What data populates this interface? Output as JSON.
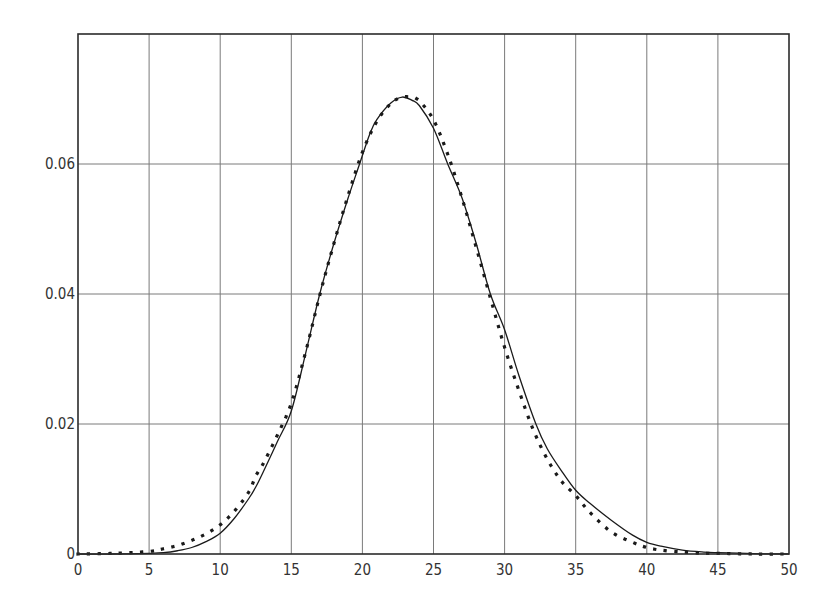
{
  "chart_data": {
    "type": "line",
    "title": "",
    "xlabel": "",
    "ylabel": "",
    "xlim": [
      0,
      50
    ],
    "ylim": [
      0,
      0.08
    ],
    "grid": true,
    "legend": null,
    "x_ticks": [
      0,
      5,
      10,
      15,
      20,
      25,
      30,
      35,
      40,
      45,
      50
    ],
    "x_tick_labels": [
      "0",
      "5",
      "10",
      "15",
      "20",
      "25",
      "30",
      "35",
      "40",
      "45",
      "50"
    ],
    "y_ticks": [
      0,
      0.02,
      0.04,
      0.06
    ],
    "y_tick_labels": [
      "0",
      "0.02",
      "0.04",
      "0.06"
    ],
    "series": [
      {
        "name": "solid curve",
        "style": "solid",
        "color": "#1a1a1a",
        "x": [
          0,
          2.5,
          5,
          6,
          7,
          8,
          9,
          10,
          11,
          12,
          12.5,
          13,
          14,
          15,
          16,
          17,
          18,
          19,
          19.8,
          20.5,
          21,
          22,
          22.8,
          23.5,
          24,
          25,
          26,
          27,
          28,
          29,
          30,
          31,
          32.2,
          33,
          34,
          35,
          36,
          37.5,
          39,
          40,
          41,
          42.5,
          44,
          45,
          47.5,
          50
        ],
        "values": [
          0,
          0,
          0.0001,
          0.0002,
          0.0005,
          0.001,
          0.0019,
          0.0032,
          0.0055,
          0.0085,
          0.0103,
          0.0125,
          0.0172,
          0.022,
          0.0308,
          0.04,
          0.0478,
          0.0548,
          0.06,
          0.0645,
          0.0668,
          0.0694,
          0.0703,
          0.0698,
          0.069,
          0.0655,
          0.06,
          0.0548,
          0.0478,
          0.04,
          0.0345,
          0.0275,
          0.02,
          0.0162,
          0.0128,
          0.0098,
          0.0078,
          0.0052,
          0.0029,
          0.0018,
          0.0012,
          0.0006,
          0.0003,
          0.0002,
          5e-05,
          0
        ]
      },
      {
        "name": "dotted curve",
        "style": "dotted",
        "color": "#1a1a1a",
        "x": [
          0,
          2.5,
          5,
          6,
          7,
          8,
          9,
          10,
          11,
          12,
          12.5,
          13,
          14,
          15,
          16,
          17,
          18,
          19,
          20,
          21,
          22,
          22.8,
          23.5,
          24,
          25,
          26,
          27,
          28,
          29,
          30,
          31,
          32,
          33,
          34,
          35,
          36,
          37.5,
          39,
          40,
          41,
          42.5,
          44,
          45,
          47.5,
          50
        ],
        "values": [
          0,
          0.0001,
          0.0004,
          0.0008,
          0.0013,
          0.0021,
          0.0031,
          0.0045,
          0.0066,
          0.0095,
          0.012,
          0.0138,
          0.0182,
          0.0232,
          0.031,
          0.0398,
          0.0478,
          0.0552,
          0.0618,
          0.0665,
          0.0693,
          0.0703,
          0.0702,
          0.0697,
          0.0668,
          0.0615,
          0.0548,
          0.0472,
          0.0394,
          0.0318,
          0.0252,
          0.0192,
          0.0146,
          0.0112,
          0.009,
          0.0064,
          0.0034,
          0.0018,
          0.001,
          0.0006,
          0.0003,
          0.0001,
          0.0001,
          0,
          0
        ]
      }
    ]
  },
  "colors": {
    "background": "#ffffff",
    "frame": "#2b2b2b",
    "grid": "#7a7a7a",
    "curve": "#1a1a1a"
  }
}
